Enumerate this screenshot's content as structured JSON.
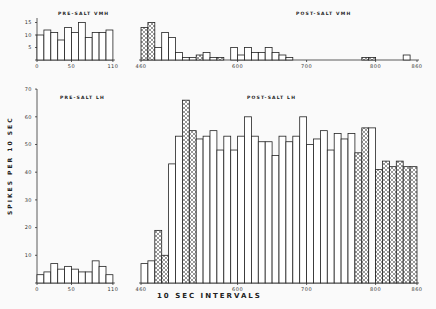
{
  "chart_data": [
    {
      "id": "pre_vmh",
      "type": "bar",
      "title": "PRE-SALT VMH",
      "x_start": 0,
      "bin": 10,
      "xticks": [
        0,
        50,
        110
      ],
      "yticks": [
        5,
        10,
        15
      ],
      "ylim": [
        0,
        16
      ],
      "values": [
        10,
        12,
        11,
        8,
        13,
        11,
        15,
        9,
        11,
        11,
        12
      ],
      "hatched": []
    },
    {
      "id": "post_vmh",
      "type": "bar",
      "title": "POST-SALT VMH",
      "x_start": 460,
      "bin": 10,
      "xticks": [
        460,
        600,
        700,
        800,
        860
      ],
      "ylim": [
        0,
        16
      ],
      "values": [
        13,
        15,
        5,
        11,
        9,
        3,
        1,
        1,
        2,
        3,
        1,
        1,
        0,
        5,
        2,
        5,
        3,
        3,
        5,
        3,
        2,
        1,
        0,
        0,
        0,
        0,
        0,
        0,
        0,
        0,
        0,
        0,
        1,
        1,
        0,
        0,
        0,
        0,
        2,
        0
      ],
      "hatched": [
        0,
        1,
        8,
        11,
        32,
        33
      ]
    },
    {
      "id": "pre_lh",
      "type": "bar",
      "title": "PRE-SALT LH",
      "x_start": 0,
      "bin": 10,
      "xticks": [
        0,
        50,
        110
      ],
      "yticks": [
        10,
        20,
        30,
        40,
        50,
        60,
        70
      ],
      "ylim": [
        0,
        70
      ],
      "values": [
        3,
        4,
        7,
        5,
        6,
        5,
        4,
        4,
        8,
        6,
        3
      ],
      "hatched": []
    },
    {
      "id": "post_lh",
      "type": "bar",
      "title": "POST-SALT LH",
      "x_start": 460,
      "bin": 10,
      "xticks": [
        460,
        600,
        700,
        800,
        860
      ],
      "ylim": [
        0,
        70
      ],
      "values": [
        7,
        8,
        19,
        10,
        43,
        53,
        66,
        55,
        52,
        53,
        55,
        48,
        53,
        48,
        53,
        60,
        53,
        51,
        51,
        46,
        53,
        51,
        53,
        60,
        50,
        52,
        55,
        48,
        54,
        52,
        54,
        47,
        56,
        56,
        41,
        44,
        42,
        44,
        42,
        42
      ],
      "hatched": [
        2,
        3,
        6,
        7,
        31,
        32,
        34,
        35,
        36,
        37,
        38,
        39
      ]
    }
  ],
  "labels": {
    "ylabel": "SPIKES PER 10 SEC",
    "xlabel": "10 SEC INTERVALS"
  }
}
